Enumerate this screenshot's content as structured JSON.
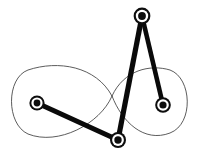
{
  "figure": {
    "background_color": "#ffffff",
    "canvas": {
      "width": 199,
      "height": 157
    },
    "curve": {
      "name": "figure-eight-coupler-curve",
      "type": "lemniscate",
      "stroke_color": "#4a4a4a",
      "stroke_width": 0.9,
      "crossing_point": {
        "x": 112,
        "y": 96
      },
      "left_loop": {
        "center_x": 62,
        "center_y": 101,
        "radius_x": 54,
        "radius_y": 37
      },
      "right_loop": {
        "center_x": 155,
        "center_y": 103,
        "radius_x": 38,
        "radius_y": 33
      },
      "path": "M 112 96 C 96 66 58 60 28 70 C 6 78 6 124 28 134 C 58 146 100 124 112 96 C 124 70 150 64 170 70 C 192 78 194 124 170 133 C 144 143 122 122 112 96 Z"
    },
    "links": [
      {
        "name": "link-left-to-bottom",
        "from_joint": "left-pivot",
        "to_joint": "bottom-pivot",
        "x1": 37,
        "y1": 103,
        "x2": 118,
        "y2": 140,
        "stroke_width": 5.0,
        "stroke_color": "#0a0a0a"
      },
      {
        "name": "link-bottom-to-top",
        "from_joint": "bottom-pivot",
        "to_joint": "top-pivot",
        "x1": 118,
        "y1": 140,
        "x2": 142,
        "y2": 16,
        "stroke_width": 5.2,
        "stroke_color": "#0a0a0a"
      },
      {
        "name": "link-top-to-right",
        "from_joint": "top-pivot",
        "to_joint": "right-pivot",
        "x1": 142,
        "y1": 16,
        "x2": 163,
        "y2": 105,
        "stroke_width": 4.6,
        "stroke_color": "#0a0a0a"
      }
    ],
    "joints": [
      {
        "name": "left-pivot",
        "label": "left ground pivot",
        "x": 37,
        "y": 103,
        "outer_radius": 7.6,
        "ring_radius": 5.6,
        "core_radius": 3.4,
        "outer_color": "#0d0d0d",
        "ring_color": "#ffffff",
        "core_color": "#0d0d0d"
      },
      {
        "name": "top-pivot",
        "label": "top coupler pivot",
        "x": 142,
        "y": 16,
        "outer_radius": 8.4,
        "ring_radius": 6.2,
        "core_radius": 3.9,
        "outer_color": "#0d0d0d",
        "ring_color": "#ffffff",
        "core_color": "#0d0d0d"
      },
      {
        "name": "right-pivot",
        "label": "right ground pivot",
        "x": 163,
        "y": 105,
        "outer_radius": 7.8,
        "ring_radius": 5.8,
        "core_radius": 3.6,
        "outer_color": "#0d0d0d",
        "ring_color": "#ffffff",
        "core_color": "#0d0d0d"
      },
      {
        "name": "bottom-pivot",
        "label": "bottom coupler pivot",
        "x": 118,
        "y": 140,
        "outer_radius": 8.0,
        "ring_radius": 5.9,
        "core_radius": 3.7,
        "outer_color": "#0d0d0d",
        "ring_color": "#ffffff",
        "core_color": "#0d0d0d"
      }
    ]
  }
}
